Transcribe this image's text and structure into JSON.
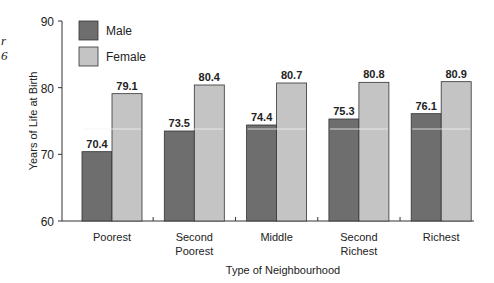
{
  "chart_data": {
    "type": "bar",
    "title": "",
    "xlabel": "Type of Neighbourhood",
    "ylabel": "Years of Life at Birth",
    "ylim": [
      60,
      90
    ],
    "yticks": [
      60,
      70,
      80,
      90
    ],
    "grid": false,
    "legend_position": "top-left",
    "categories": [
      "Poorest",
      "Second Poorest",
      "Middle",
      "Second Richest",
      "Richest"
    ],
    "category_lines": [
      [
        "Poorest"
      ],
      [
        "Second",
        "Poorest"
      ],
      [
        "Middle"
      ],
      [
        "Second",
        "Richest"
      ],
      [
        "Richest"
      ]
    ],
    "series": [
      {
        "name": "Male",
        "color": "#6e6e6e",
        "values": [
          70.4,
          73.5,
          74.4,
          75.3,
          76.1
        ]
      },
      {
        "name": "Female",
        "color": "#c4c4c4",
        "values": [
          79.1,
          80.4,
          80.7,
          80.8,
          80.9
        ]
      }
    ]
  },
  "margin_marks": [
    "r",
    "6"
  ]
}
